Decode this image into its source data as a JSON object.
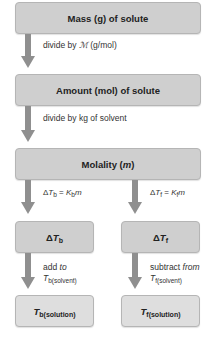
{
  "diagram": {
    "colors": {
      "box_fill": "#cfcfcf",
      "box_fill_light": "#dedede",
      "box_border": "#b5b5b5",
      "arrow": "#8f8f8f",
      "text": "#222222"
    },
    "boxes": {
      "mass": "Mass (g) of solute",
      "amount": "Amount (mol) of solute",
      "molality_prefix": "Molality (",
      "molality_var": "m",
      "molality_suffix": ")",
      "delta_tb_delta": "Δ",
      "delta_tb_var": "T",
      "delta_tb_sub": "b",
      "delta_tf_delta": "Δ",
      "delta_tf_var": "T",
      "delta_tf_sub": "f",
      "tb_solution_var": "T",
      "tb_solution_sub": "b(solution)",
      "tf_solution_var": "T",
      "tf_solution_sub": "f(solution)"
    },
    "steps": {
      "mass_to_amount_prefix": "divide by ",
      "mass_to_amount_symbol": "ℳ",
      "mass_to_amount_suffix": " (g/mol)",
      "amount_to_molality": "divide by kg of solvent",
      "boiling_eq": {
        "delta": "Δ",
        "T": "T",
        "T_sub": "b",
        "eq": " = ",
        "K": "K",
        "K_sub": "b",
        "m": "m"
      },
      "freezing_eq": {
        "delta": "Δ",
        "T": "T",
        "T_sub": "f",
        "eq": " = ",
        "K": "K",
        "K_sub": "f",
        "m": "m"
      },
      "add_to_prefix": "add ",
      "add_to_word": "to",
      "add_T": "T",
      "add_T_sub": "b(solvent)",
      "subtract_prefix": "subtract ",
      "subtract_word": "from",
      "subtract_T": "T",
      "subtract_T_sub": "f(solvent)"
    }
  }
}
